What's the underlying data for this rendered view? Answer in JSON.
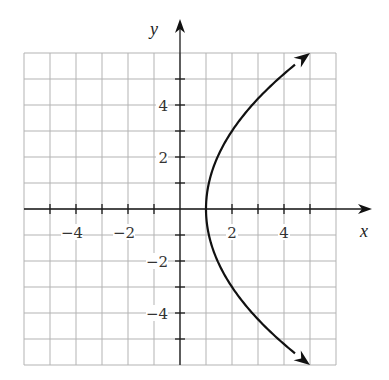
{
  "chart_data": {
    "type": "line",
    "title": "",
    "xlabel": "x",
    "ylabel": "y",
    "xlim": [
      -6,
      6
    ],
    "ylim": [
      -6,
      6
    ],
    "grid": true,
    "grid_step": 1,
    "x_ticks": [
      -5,
      -4,
      -3,
      -2,
      -1,
      1,
      2,
      3,
      4,
      5
    ],
    "y_ticks": [
      -5,
      -4,
      -3,
      -2,
      -1,
      1,
      2,
      3,
      4,
      5
    ],
    "x_tick_labels": [
      {
        "value": -4,
        "text": "−4"
      },
      {
        "value": -2,
        "text": "−2"
      },
      {
        "value": 2,
        "text": "2"
      },
      {
        "value": 4,
        "text": "4"
      }
    ],
    "y_tick_labels": [
      {
        "value": 4,
        "text": "4"
      },
      {
        "value": 2,
        "text": "2"
      },
      {
        "value": -2,
        "text": "−2"
      },
      {
        "value": -4,
        "text": "−4"
      }
    ],
    "series": [
      {
        "name": "x = 1 + y^2/9",
        "equation": "y^2 = 9(x - 1)",
        "description": "Parabola opening right, vertex (1, 0), arrows at both ends",
        "points": [
          {
            "x": 5,
            "y": -6
          },
          {
            "x": 3.78,
            "y": -5
          },
          {
            "x": 2.78,
            "y": -4
          },
          {
            "x": 2,
            "y": -3
          },
          {
            "x": 1.44,
            "y": -2
          },
          {
            "x": 1.11,
            "y": -1
          },
          {
            "x": 1,
            "y": 0
          },
          {
            "x": 1.11,
            "y": 1
          },
          {
            "x": 1.44,
            "y": 2
          },
          {
            "x": 2,
            "y": 3
          },
          {
            "x": 2.78,
            "y": 4
          },
          {
            "x": 3.78,
            "y": 5
          },
          {
            "x": 5,
            "y": 6
          }
        ],
        "arrow_ends": true
      }
    ]
  },
  "layout": {
    "origin_px": [
      180,
      209
    ],
    "unit_px": 26,
    "x_axis_end_px": 372,
    "y_axis_top_px": 19
  }
}
